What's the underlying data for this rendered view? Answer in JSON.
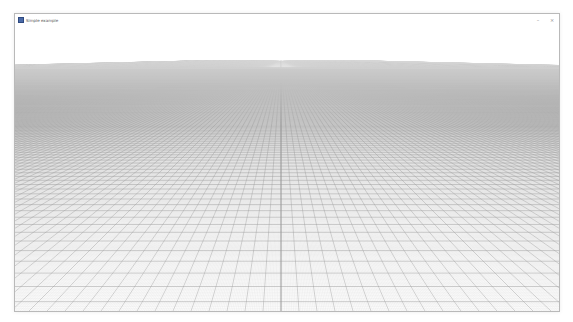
{
  "window": {
    "title": "Simple example",
    "controls": {
      "minimize": "–",
      "close": "×"
    }
  },
  "scene": {
    "description": "3D perspective ground grid",
    "background": "#ffffff",
    "major_line_color": "#9a9a9a",
    "minor_line_color": "#dcdcdc",
    "axis_line_color": "#7a7a7a"
  }
}
